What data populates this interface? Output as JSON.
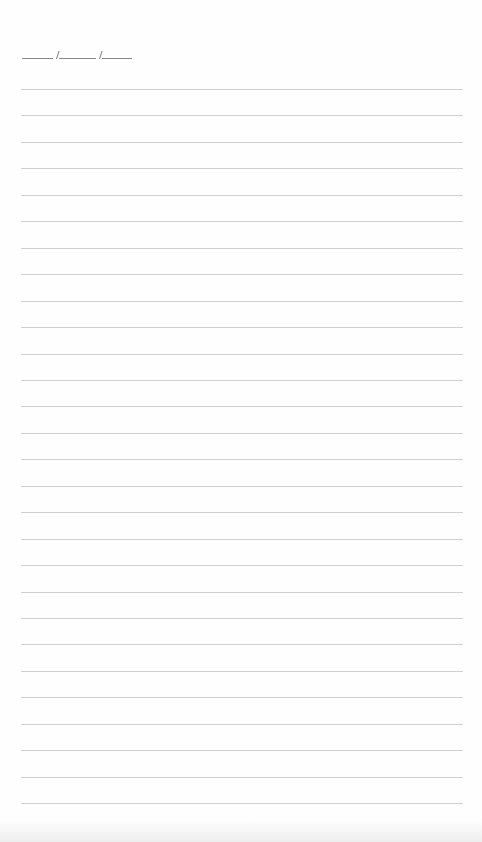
{
  "page": {
    "type": "lined-notepaper",
    "date_field": {
      "template": "____/_____/____",
      "separator": "/",
      "segments": 3
    },
    "ruled_lines": {
      "count": 28,
      "first_y": 89,
      "spacing": 26.45,
      "left": 21,
      "width": 442
    },
    "colors": {
      "paper": "#fefefe",
      "rule": "#cfcfcf",
      "date_marks": "#8a8a8a"
    }
  }
}
